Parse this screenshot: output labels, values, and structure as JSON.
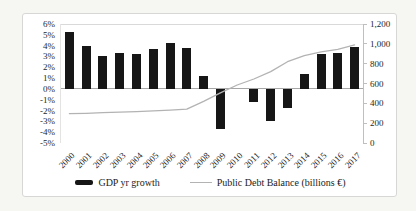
{
  "chart_data": {
    "type": "bar",
    "subtype": "combo bar+line, dual axis",
    "categories": [
      "2000",
      "2001",
      "2002",
      "2003",
      "2004",
      "2005",
      "2006",
      "2007",
      "2008",
      "2009",
      "2010",
      "2011",
      "2012",
      "2013",
      "2014",
      "2015",
      "2016",
      "2017"
    ],
    "series": [
      {
        "name": "GDP yr growth",
        "type": "bar",
        "axis": "left",
        "color": "#161616",
        "values": [
          5.3,
          4.0,
          3.0,
          3.3,
          3.2,
          3.7,
          4.2,
          3.8,
          1.2,
          -3.7,
          0.0,
          -1.2,
          -3.0,
          -1.8,
          1.4,
          3.2,
          3.3,
          3.9
        ]
      },
      {
        "name": "Public Debt Balance (billions €)",
        "type": "line",
        "axis": "right",
        "color": "#b3b3b3",
        "values": [
          295,
          300,
          306,
          311,
          317,
          324,
          332,
          341,
          420,
          505,
          585,
          645,
          720,
          820,
          880,
          920,
          945,
          990
        ]
      }
    ],
    "title": "",
    "xlabel": "",
    "ylabel_left": "",
    "ylabel_right": "",
    "left_axis": {
      "min": -5,
      "max": 6,
      "step": 1,
      "format": "percent",
      "tick_labels": [
        "6%",
        "5%",
        "4%",
        "3%",
        "2%",
        "1%",
        "0%",
        "-1%",
        "-2%",
        "-3%",
        "-4%",
        "-5%"
      ]
    },
    "right_axis": {
      "min": 0,
      "max": 1200,
      "step": 200,
      "tick_labels": [
        "1,200",
        "1,000",
        "800",
        "600",
        "400",
        "200",
        "0"
      ]
    },
    "grid": "top border and zero line only, no vertical gridlines",
    "legend_position": "bottom center",
    "legend": [
      {
        "label": "GDP yr growth",
        "swatch": "bar"
      },
      {
        "label": "Public Debt Balance (billions €)",
        "swatch": "line"
      }
    ]
  }
}
